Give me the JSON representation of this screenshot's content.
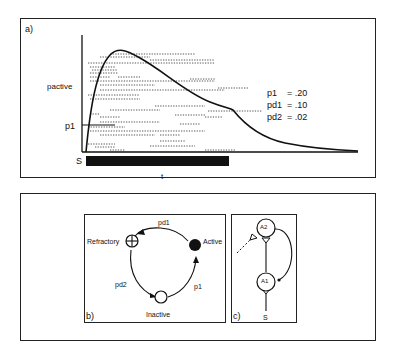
{
  "panel_a": {
    "label": "a)",
    "y_label": "pactive",
    "p1_label": "p1",
    "stimulus_label": "S",
    "time_label": "t",
    "legend": [
      {
        "name": "p1",
        "value": "= .20"
      },
      {
        "name": "pd1",
        "value": "= .10"
      },
      {
        "name": "pd2",
        "value": "= .02"
      }
    ]
  },
  "panel_b": {
    "label": "b)",
    "states": {
      "refractory": "Refractory",
      "active": "Active",
      "inactive": "Inactive"
    },
    "transitions": {
      "active_to_refractory": "pd1",
      "refractory_to_inactive": "pd2",
      "inactive_to_active": "p1"
    }
  },
  "panel_c": {
    "label": "c)",
    "node_top": "A2",
    "node_bottom": "A1",
    "input_label": "S"
  },
  "colors": {
    "ink": "#111111",
    "background": "#ffffff",
    "raster": "#555555"
  }
}
